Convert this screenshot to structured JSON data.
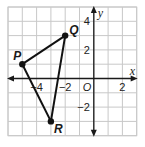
{
  "diagram": {
    "type": "coordinate-plane",
    "x_range": [
      -6,
      3
    ],
    "y_range": [
      -4,
      5
    ],
    "grid": true,
    "axis_labels": {
      "x": "x",
      "y": "y",
      "origin": "O"
    },
    "x_ticks": [
      {
        "value": -4,
        "label": "−4"
      },
      {
        "value": -2,
        "label": "−2"
      },
      {
        "value": 2,
        "label": "2"
      }
    ],
    "y_ticks": [
      {
        "value": 4,
        "label": "4"
      },
      {
        "value": 2,
        "label": "2"
      },
      {
        "value": -2,
        "label": "−2"
      }
    ],
    "points": [
      {
        "name": "P",
        "x": -5,
        "y": 1
      },
      {
        "name": "Q",
        "x": -2,
        "y": 3
      },
      {
        "name": "R",
        "x": -3,
        "y": -3
      }
    ],
    "segments": [
      [
        "P",
        "Q"
      ],
      [
        "Q",
        "R"
      ],
      [
        "R",
        "P"
      ]
    ]
  }
}
